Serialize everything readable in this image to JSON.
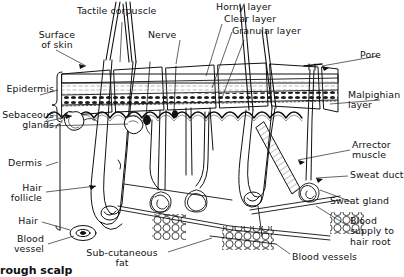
{
  "figure": {
    "caption_visible": "rough scalp",
    "background": "#ffffff",
    "ink": "#111111"
  },
  "labels": {
    "surface_of_skin": "Surface\nof skin",
    "tactile_corpuscle": "Tactile corpuscle",
    "nerve": "Nerve",
    "horny_layer": "Horny layer",
    "clear_layer": "Clear layer",
    "granular_layer": "Granular layer",
    "pore": "Pore",
    "malpighian_layer": "Malpighian\nlayer",
    "epidermis": "Epidermis",
    "sebaceous_glands": "Sebaceous\nglands",
    "dermis": "Dermis",
    "hair_follicle": "Hair\nfollicle",
    "hair": "Hair",
    "blood_vessel": "Blood\nvessel",
    "sub_cutaneous_fat": "Sub-cutaneous\nfat",
    "arrector_muscle": "Arrector\nmuscle",
    "sweat_duct": "Sweat duct",
    "sweat_gland": "Sweat gland",
    "blood_supply_to_hair_root": "Blood\nsupply to\nhair root",
    "blood_vessels": "Blood vessels"
  },
  "structures": [
    "epidermis-strata",
    "horny-layer-band",
    "clear-layer-band",
    "granular-layer-band",
    "malpighian-layer-band",
    "dermis-papillae",
    "hair-shaft",
    "hair-follicle-bulb",
    "sebaceous-gland",
    "arrector-pili-muscle",
    "sweat-gland-coil",
    "sweat-duct",
    "pore-opening",
    "subcutaneous-fat-cells",
    "blood-vessel",
    "nerve-fibre",
    "tactile-corpuscle"
  ]
}
